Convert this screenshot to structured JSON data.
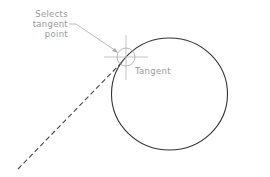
{
  "annotation": {
    "callout_lines": [
      "Selects",
      "tangent",
      "point"
    ],
    "tangent_label": "Tangent"
  },
  "colors": {
    "circle": "#333333",
    "dashed_line": "#444444",
    "annotation": "#9a9a9a",
    "background": "#ffffff"
  }
}
